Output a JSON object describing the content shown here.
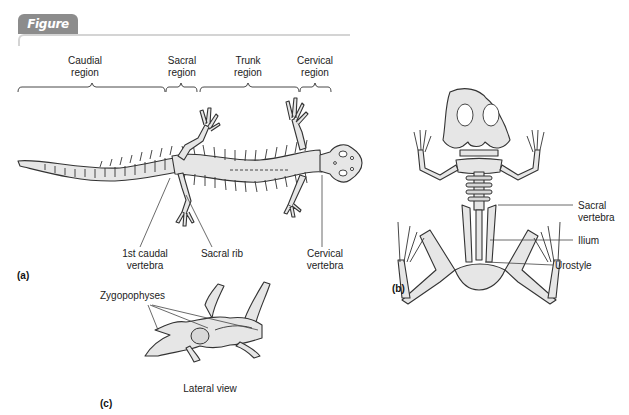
{
  "figure": {
    "title": "Figure 16.9",
    "accent_color": "#8c8c8c"
  },
  "panel_a": {
    "label": "(a)",
    "regions": [
      {
        "name": "Caudial",
        "sub": "region"
      },
      {
        "name": "Sacral",
        "sub": "region"
      },
      {
        "name": "Trunk",
        "sub": "region"
      },
      {
        "name": "Cervical",
        "sub": "region"
      }
    ],
    "callouts": [
      {
        "line1": "1st caudal",
        "line2": "vertebra"
      },
      {
        "line1": "Sacral rib",
        "line2": ""
      },
      {
        "line1": "Cervical",
        "line2": "vertebra"
      }
    ]
  },
  "panel_b": {
    "label": "(b)",
    "callouts": [
      {
        "line1": "Sacral",
        "line2": "vertebra"
      },
      {
        "line1": "Ilium",
        "line2": ""
      },
      {
        "line1": "Urostyle",
        "line2": ""
      }
    ]
  },
  "panel_c": {
    "label": "(c)",
    "callout": "Zygopophyses",
    "caption": "Lateral view"
  },
  "colors": {
    "bone_fill": "#e6e6e6",
    "bone_stroke": "#333333",
    "leader_line": "#444444"
  }
}
